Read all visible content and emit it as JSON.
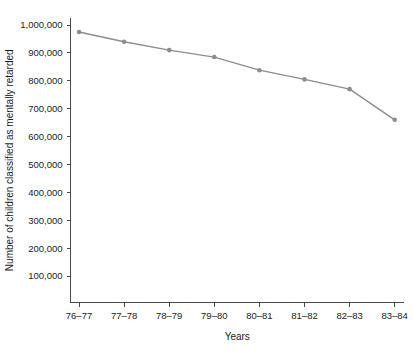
{
  "chart_data": {
    "type": "line",
    "title": "",
    "subtitle": "",
    "xlabel": "Years",
    "ylabel": "Number of children classified as mentally retarded",
    "categories": [
      "76–77",
      "77–78",
      "78–79",
      "79–80",
      "80–81",
      "81–82",
      "82–83",
      "83–84"
    ],
    "values": [
      975000,
      940000,
      910000,
      885000,
      838000,
      805000,
      770000,
      660000
    ],
    "series": [
      {
        "name": "Children classified as mentally retarded",
        "values": [
          975000,
          940000,
          910000,
          885000,
          838000,
          805000,
          770000,
          660000
        ]
      }
    ],
    "ylim": [
      0,
      1040000
    ],
    "ytick_values": [
      100000,
      200000,
      300000,
      400000,
      500000,
      600000,
      700000,
      800000,
      900000,
      1000000
    ],
    "ytick_labels": [
      "100,000",
      "200,000",
      "300,000",
      "400,000",
      "500,000",
      "600,000",
      "700,000",
      "800,000",
      "900,000",
      "1,000,000"
    ],
    "xtick_labels": [
      "76–77",
      "77–78",
      "78–79",
      "79–80",
      "80–81",
      "81–82",
      "82–83",
      "83–84"
    ],
    "grid": false,
    "legend": false,
    "legend_position": "none",
    "line_color": "#8d8d8d",
    "marker_color": "#8d8d8d",
    "marker_shape": "circle",
    "axis_color": "#4a4a4a",
    "text_color": "#1c1c1c",
    "background_color": "#ffffff"
  }
}
